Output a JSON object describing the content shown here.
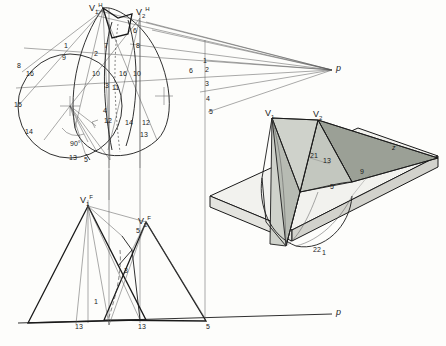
{
  "colors": {
    "line": "#1a1a1a",
    "thin": "#555555",
    "shade_light": "#d9dcd6",
    "shade_mid": "#b9bdb6",
    "shade_dark": "#8f948c",
    "paper": "#f2f2ee",
    "background": "#ffffff"
  },
  "diagram": {
    "views": [
      {
        "id": "top-view",
        "name": "plan view with circle and cone outlines"
      },
      {
        "id": "front-view",
        "name": "front elevation with apex V1F and V2F"
      },
      {
        "id": "pictorial-view",
        "name": "3D pictorial of shaded cones on base plane"
      }
    ],
    "ground_lines": [
      {
        "id": "horizontal-axis-top",
        "label": "p"
      },
      {
        "id": "horizontal-axis-bottom",
        "label": "p"
      }
    ]
  },
  "labels": [
    {
      "name": "apex-v1h",
      "text": "V",
      "sub": "1",
      "sup": "H",
      "x": 93,
      "y": 6
    },
    {
      "name": "apex-v2h",
      "text": "V",
      "sub": "2",
      "sup": "H",
      "x": 139,
      "y": 10
    },
    {
      "name": "point-p-right",
      "text": "p",
      "x": 334,
      "y": 69
    },
    {
      "name": "point-p-bottom",
      "text": "p",
      "x": 334,
      "y": 314
    },
    {
      "name": "apex-v1f",
      "text": "V",
      "sub": "1",
      "sup": "F",
      "x": 84,
      "y": 198
    },
    {
      "name": "apex-v2f",
      "text": "V",
      "sub": "2",
      "sup": "F",
      "x": 142,
      "y": 219
    },
    {
      "name": "apex-v1-pictorial",
      "text": "V",
      "sub": "1",
      "x": 268,
      "y": 113
    },
    {
      "name": "apex-v2-pictorial",
      "text": "V",
      "sub": "2",
      "x": 316,
      "y": 114
    },
    {
      "name": "angle-90",
      "text": "90°",
      "x": 72,
      "y": 144
    },
    {
      "name": "num-1-a",
      "text": "1",
      "x": 64,
      "y": 46
    },
    {
      "name": "num-8-a",
      "text": "8",
      "x": 19,
      "y": 66
    },
    {
      "name": "num-16-a",
      "text": "16",
      "x": 27,
      "y": 73
    },
    {
      "name": "num-9-a",
      "text": "9",
      "x": 63,
      "y": 58
    },
    {
      "name": "num-15-a",
      "text": "15",
      "x": 16,
      "y": 105
    },
    {
      "name": "num-14-a",
      "text": "14",
      "x": 26,
      "y": 132
    },
    {
      "name": "num-13-a",
      "text": "13",
      "x": 70,
      "y": 158
    },
    {
      "name": "num-5-a",
      "text": "5",
      "x": 84,
      "y": 160
    },
    {
      "name": "num-7-a",
      "text": "7",
      "x": 105,
      "y": 46
    },
    {
      "name": "num-2-a",
      "text": "2",
      "x": 95,
      "y": 54
    },
    {
      "name": "num-10-a",
      "text": "10",
      "x": 94,
      "y": 74
    },
    {
      "name": "num-3-a",
      "text": "3",
      "x": 106,
      "y": 86
    },
    {
      "name": "num-11-a",
      "text": "11",
      "x": 113,
      "y": 88
    },
    {
      "name": "num-4-a",
      "text": "4",
      "x": 104,
      "y": 111
    },
    {
      "name": "num-12-a",
      "text": "12",
      "x": 106,
      "y": 121
    },
    {
      "name": "num-6-b",
      "text": "6",
      "x": 133,
      "y": 31
    },
    {
      "name": "num-8-b",
      "text": "8",
      "x": 137,
      "y": 46
    },
    {
      "name": "num-16-b",
      "text": "16",
      "x": 121,
      "y": 74
    },
    {
      "name": "num-10-b",
      "text": "10",
      "x": 134,
      "y": 74
    },
    {
      "name": "num-14-b",
      "text": "14",
      "x": 127,
      "y": 123
    },
    {
      "name": "num-12-b",
      "text": "12",
      "x": 143,
      "y": 123
    },
    {
      "name": "num-13-b",
      "text": "13",
      "x": 141,
      "y": 135
    },
    {
      "name": "num-5-b",
      "text": "5",
      "x": 209,
      "y": 112
    },
    {
      "name": "num-1-c",
      "text": "1",
      "x": 203,
      "y": 61
    },
    {
      "name": "num-2-c",
      "text": "2",
      "x": 205,
      "y": 70
    },
    {
      "name": "num-3-c",
      "text": "3",
      "x": 205,
      "y": 84
    },
    {
      "name": "num-4-c",
      "text": "4",
      "x": 206,
      "y": 99
    },
    {
      "name": "num-6-c",
      "text": "6",
      "x": 190,
      "y": 71
    },
    {
      "name": "num-3-f",
      "text": "3",
      "x": 125,
      "y": 271
    },
    {
      "name": "num-1-f",
      "text": "1",
      "x": 95,
      "y": 302
    },
    {
      "name": "num-13-f-left",
      "text": "13",
      "x": 76,
      "y": 327
    },
    {
      "name": "num-13-f-right",
      "text": "13",
      "x": 139,
      "y": 327
    },
    {
      "name": "num-5-f",
      "text": "5",
      "x": 207,
      "y": 327
    },
    {
      "name": "num-5-pic",
      "text": "5",
      "x": 137,
      "y": 231
    },
    {
      "name": "num-21-pic",
      "text": "21",
      "x": 311,
      "y": 156
    },
    {
      "name": "num-13-pic",
      "text": "13",
      "x": 324,
      "y": 161
    },
    {
      "name": "num-9-pic",
      "text": "9",
      "x": 361,
      "y": 172
    },
    {
      "name": "num-5-pic2",
      "text": "5",
      "x": 331,
      "y": 187
    },
    {
      "name": "num-22-pic",
      "text": "22",
      "x": 314,
      "y": 250
    },
    {
      "name": "num-1-pic",
      "text": "1",
      "x": 323,
      "y": 253
    },
    {
      "name": "num-z-pic",
      "text": "z",
      "x": 393,
      "y": 148
    }
  ]
}
